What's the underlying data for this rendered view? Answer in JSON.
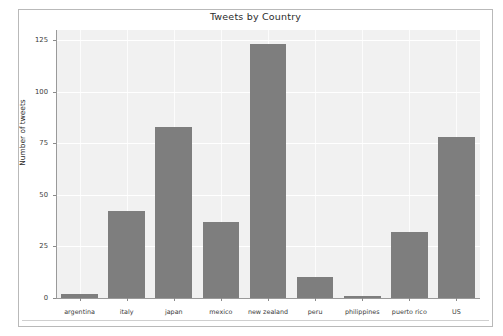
{
  "figure": {
    "title": "Tweets by Country",
    "background_color": "#ffffff",
    "plot_background_color": "#f1f1f1",
    "bar_color": "#7e7e7e",
    "grid_color": "#ffffff"
  },
  "chart_data": {
    "type": "bar",
    "title": "Tweets by Country",
    "xlabel": "",
    "ylabel": "Number of tweets",
    "categories": [
      "argentina",
      "italy",
      "japan",
      "mexico",
      "new zealand",
      "peru",
      "philippines",
      "puerto rico",
      "US"
    ],
    "values": [
      2,
      42,
      83,
      37,
      123,
      10,
      1,
      32,
      78
    ],
    "ylim": [
      0,
      130
    ],
    "yticks": [
      0,
      25,
      50,
      75,
      100,
      125
    ],
    "ytick_labels": [
      "0",
      "25",
      "50",
      "75",
      "100",
      "125"
    ],
    "grid": true,
    "legend": false
  }
}
